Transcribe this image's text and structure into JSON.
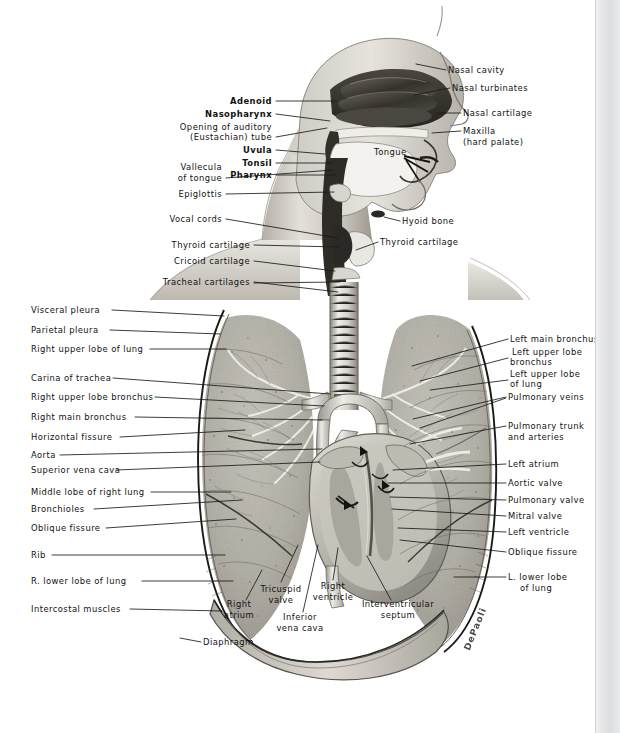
{
  "figure": {
    "signature": "DePaoli"
  },
  "colors": {
    "ink": "#111111",
    "leader": "#1a1a1a",
    "paper": "#ffffff",
    "gutter": "#e4e5e6",
    "lung_tissue": "#b9b6ad",
    "skin_light": "#dcd9d2",
    "skin_mid": "#b8b4ac",
    "cavity_dark": "#3a3733",
    "vessel": "#cfccc4"
  },
  "labels_head_left": [
    {
      "id": "adenoid",
      "text": "Adenoid",
      "bold": true,
      "x": 272,
      "y": 104,
      "align": "right"
    },
    {
      "id": "nasopharynx",
      "text": "Nasopharynx",
      "bold": true,
      "x": 272,
      "y": 117,
      "align": "right"
    },
    {
      "id": "eustachian-1",
      "text": "Opening of auditory",
      "bold": false,
      "x": 272,
      "y": 130,
      "align": "right"
    },
    {
      "id": "eustachian-2",
      "text": "(Eustachian) tube",
      "bold": false,
      "x": 272,
      "y": 140,
      "align": "right"
    },
    {
      "id": "uvula",
      "text": "Uvula",
      "bold": true,
      "x": 272,
      "y": 153,
      "align": "right"
    },
    {
      "id": "tonsil",
      "text": "Tonsil",
      "bold": true,
      "x": 272,
      "y": 166,
      "align": "right"
    },
    {
      "id": "pharynx",
      "text": "Pharynx",
      "bold": true,
      "x": 272,
      "y": 178,
      "align": "right"
    }
  ],
  "labels_neck_left": [
    {
      "id": "vallecula-1",
      "text": "Vallecula",
      "x": 222,
      "y": 170,
      "align": "right"
    },
    {
      "id": "vallecula-2",
      "text": "of tongue",
      "x": 222,
      "y": 181,
      "align": "right"
    },
    {
      "id": "epiglottis",
      "text": "Epiglottis",
      "x": 222,
      "y": 197,
      "align": "right"
    },
    {
      "id": "vocal-cords",
      "text": "Vocal cords",
      "x": 222,
      "y": 222,
      "align": "right"
    },
    {
      "id": "thyroid-cartilage-l",
      "text": "Thyroid cartilage",
      "x": 250,
      "y": 248,
      "align": "right"
    },
    {
      "id": "cricoid-cartilage",
      "text": "Cricoid cartilage",
      "x": 250,
      "y": 264,
      "align": "right"
    },
    {
      "id": "tracheal-cartilages",
      "text": "Tracheal cartilages",
      "x": 250,
      "y": 285,
      "align": "right"
    }
  ],
  "labels_head_right": [
    {
      "id": "nasal-cavity",
      "text": "Nasal cavity",
      "x": 448,
      "y": 73
    },
    {
      "id": "nasal-turbinates",
      "text": "Nasal turbinates",
      "x": 452,
      "y": 91
    },
    {
      "id": "nasal-cartilage",
      "text": "Nasal cartilage",
      "x": 463,
      "y": 116
    },
    {
      "id": "maxilla-1",
      "text": "Maxilla",
      "x": 463,
      "y": 134
    },
    {
      "id": "maxilla-2",
      "text": "(hard palate)",
      "x": 463,
      "y": 145
    },
    {
      "id": "hyoid-bone",
      "text": "Hyoid bone",
      "x": 402,
      "y": 224
    },
    {
      "id": "thyroid-cartilage-r",
      "text": "Thyroid cartilage",
      "x": 380,
      "y": 245
    }
  ],
  "label_tongue": {
    "id": "tongue",
    "text": "Tongue",
    "x": 374,
    "y": 155
  },
  "labels_thorax_left": [
    {
      "id": "visceral-pleura",
      "text": "Visceral pleura",
      "x": 31,
      "y": 313
    },
    {
      "id": "parietal-pleura",
      "text": "Parietal pleura",
      "x": 31,
      "y": 333
    },
    {
      "id": "right-upper-lobe",
      "text": "Right upper lobe of lung",
      "x": 31,
      "y": 352
    },
    {
      "id": "carina-of-trachea",
      "text": "Carina of trachea",
      "x": 31,
      "y": 381
    },
    {
      "id": "right-upper-lobe-bronchus",
      "text": "Right upper lobe bronchus",
      "x": 31,
      "y": 400
    },
    {
      "id": "right-main-bronchus",
      "text": "Right main bronchus",
      "x": 31,
      "y": 420
    },
    {
      "id": "horizontal-fissure",
      "text": "Horizontal fissure",
      "x": 31,
      "y": 440
    },
    {
      "id": "aorta",
      "text": "Aorta",
      "x": 31,
      "y": 458
    },
    {
      "id": "superior-vena-cava",
      "text": "Superior vena cava",
      "x": 31,
      "y": 473
    },
    {
      "id": "middle-lobe-right-lung",
      "text": "Middle lobe of right lung",
      "x": 31,
      "y": 495
    },
    {
      "id": "bronchioles",
      "text": "Bronchioles",
      "x": 31,
      "y": 512
    },
    {
      "id": "oblique-fissure-left",
      "text": "Oblique fissure",
      "x": 31,
      "y": 531
    },
    {
      "id": "rib",
      "text": "Rib",
      "x": 31,
      "y": 558
    },
    {
      "id": "r-lower-lobe-of-lung",
      "text": "R. lower lobe of lung",
      "x": 31,
      "y": 584
    },
    {
      "id": "intercostal-muscles",
      "text": "Intercostal muscles",
      "x": 31,
      "y": 612
    },
    {
      "id": "diaphragm",
      "text": "Diaphragm",
      "x": 203,
      "y": 645
    }
  ],
  "labels_thorax_right": [
    {
      "id": "left-main-bronchus",
      "text": "Left main bronchus",
      "x": 510,
      "y": 342
    },
    {
      "id": "left-upper-lobe-bronchus-1",
      "text": "Left upper lobe",
      "x": 512,
      "y": 355
    },
    {
      "id": "left-upper-lobe-bronchus-2",
      "text": "bronchus",
      "x": 510,
      "y": 365
    },
    {
      "id": "left-upper-lobe-lung-1",
      "text": "Left upper lobe",
      "x": 510,
      "y": 377
    },
    {
      "id": "left-upper-lobe-lung-2",
      "text": "of lung",
      "x": 510,
      "y": 387
    },
    {
      "id": "pulmonary-veins",
      "text": "Pulmonary veins",
      "x": 508,
      "y": 400
    },
    {
      "id": "pulmonary-trunk-1",
      "text": "Pulmonary trunk",
      "x": 508,
      "y": 429
    },
    {
      "id": "pulmonary-trunk-2",
      "text": "and arteries",
      "x": 508,
      "y": 440
    },
    {
      "id": "left-atrium",
      "text": "Left atrium",
      "x": 508,
      "y": 467
    },
    {
      "id": "aortic-valve",
      "text": "Aortic valve",
      "x": 508,
      "y": 486
    },
    {
      "id": "pulmonary-valve",
      "text": "Pulmonary valve",
      "x": 508,
      "y": 503
    },
    {
      "id": "mitral-valve",
      "text": "Mitral valve",
      "x": 508,
      "y": 519
    },
    {
      "id": "left-ventricle",
      "text": "Left ventricle",
      "x": 508,
      "y": 535
    },
    {
      "id": "oblique-fissure-right",
      "text": "Oblique fissure",
      "x": 508,
      "y": 555
    },
    {
      "id": "l-lower-lobe-1",
      "text": "L. lower lobe",
      "x": 508,
      "y": 580
    },
    {
      "id": "l-lower-lobe-2",
      "text": "of lung",
      "x": 520,
      "y": 591
    }
  ],
  "labels_heart_bottom": [
    {
      "id": "right-atrium-1",
      "text": "Right",
      "x": 239,
      "y": 607,
      "align": "center"
    },
    {
      "id": "right-atrium-2",
      "text": "atrium",
      "x": 239,
      "y": 618,
      "align": "center"
    },
    {
      "id": "tricuspid-valve-1",
      "text": "Tricuspid",
      "x": 281,
      "y": 592,
      "align": "center"
    },
    {
      "id": "tricuspid-valve-2",
      "text": "valve",
      "x": 281,
      "y": 603,
      "align": "center"
    },
    {
      "id": "inferior-vena-cava-1",
      "text": "Inferior",
      "x": 300,
      "y": 620,
      "align": "center"
    },
    {
      "id": "inferior-vena-cava-2",
      "text": "vena cava",
      "x": 300,
      "y": 631,
      "align": "center"
    },
    {
      "id": "right-ventricle-1",
      "text": "Right",
      "x": 333,
      "y": 589,
      "align": "center"
    },
    {
      "id": "right-ventricle-2",
      "text": "ventricle",
      "x": 333,
      "y": 600,
      "align": "center"
    },
    {
      "id": "interventricular-1",
      "text": "Interventricular",
      "x": 398,
      "y": 607,
      "align": "center"
    },
    {
      "id": "interventricular-2",
      "text": "septum",
      "x": 398,
      "y": 618,
      "align": "center"
    }
  ],
  "leaders": [
    {
      "id": "ld-adenoid",
      "d": "M276,101 L336,101"
    },
    {
      "id": "ld-nasopharynx",
      "d": "M276,114 L330,121"
    },
    {
      "id": "ld-eustachian",
      "d": "M276,137 L327,128"
    },
    {
      "id": "ld-uvula",
      "d": "M276,150 L325,154"
    },
    {
      "id": "ld-tonsil",
      "d": "M276,163 L332,163"
    },
    {
      "id": "ld-pharynx",
      "d": "M276,175 L336,175"
    },
    {
      "id": "ld-vallecula",
      "d": "M226,178 L333,170"
    },
    {
      "id": "ld-epiglottis",
      "d": "M226,194 L334,192"
    },
    {
      "id": "ld-vocalcords",
      "d": "M226,219 L338,238"
    },
    {
      "id": "ld-thyroid-l",
      "d": "M254,245 L338,247"
    },
    {
      "id": "ld-cricoid",
      "d": "M254,261 L335,271"
    },
    {
      "id": "ld-tracheal-a",
      "d": "M254,282 L338,292"
    },
    {
      "id": "ld-tracheal-b",
      "d": "M254,283 L340,282"
    },
    {
      "id": "ld-nasal-cavity",
      "d": "M446,70 L416,64"
    },
    {
      "id": "ld-nasal-turb",
      "d": "M450,88 L414,95"
    },
    {
      "id": "ld-nasal-cart",
      "d": "M461,113 L437,113"
    },
    {
      "id": "ld-maxilla",
      "d": "M461,131 L432,133"
    },
    {
      "id": "ld-hyoid",
      "d": "M400,221 L384,217"
    },
    {
      "id": "ld-thyroid-r",
      "d": "M378,242 L356,250"
    },
    {
      "id": "ld-visceral",
      "d": "M112,310 L224,316"
    },
    {
      "id": "ld-parietal",
      "d": "M110,330 L220,334"
    },
    {
      "id": "ld-rul",
      "d": "M150,349 L226,349"
    },
    {
      "id": "ld-carina",
      "d": "M113,378 L330,394"
    },
    {
      "id": "ld-rulb",
      "d": "M155,397 L324,406"
    },
    {
      "id": "ld-rmb",
      "d": "M135,417 L322,420"
    },
    {
      "id": "ld-horizontal",
      "d": "M120,437 L245,430"
    },
    {
      "id": "ld-aorta",
      "d": "M60,455 L322,449"
    },
    {
      "id": "ld-svc",
      "d": "M116,470 L320,462"
    },
    {
      "id": "ld-middle-lobe",
      "d": "M151,492 L231,492"
    },
    {
      "id": "ld-bronchioles",
      "d": "M94,509 L242,500"
    },
    {
      "id": "ld-obl-l",
      "d": "M106,528 L236,519"
    },
    {
      "id": "ld-rib",
      "d": "M52,555 L225,555"
    },
    {
      "id": "ld-rlower",
      "d": "M142,581 L233,581"
    },
    {
      "id": "ld-intercostal",
      "d": "M130,609 L222,611"
    },
    {
      "id": "ld-diaphragm",
      "d": "M201,642 L180,638"
    },
    {
      "id": "ld-lmb",
      "d": "M508,339 L412,366"
    },
    {
      "id": "ld-lulb",
      "d": "M508,358 L420,381"
    },
    {
      "id": "ld-lull",
      "d": "M508,380 L430,390"
    },
    {
      "id": "ld-pv",
      "d": "M506,397 L413,419"
    },
    {
      "id": "ld-pv2",
      "d": "M506,398 L420,428"
    },
    {
      "id": "ld-ptrunk",
      "d": "M506,426 L410,444"
    },
    {
      "id": "ld-latrium",
      "d": "M506,464 L393,470"
    },
    {
      "id": "ld-aorticvalve",
      "d": "M506,483 L388,483"
    },
    {
      "id": "ld-pulmvalve",
      "d": "M506,500 L390,497"
    },
    {
      "id": "ld-mitral",
      "d": "M506,516 L392,509"
    },
    {
      "id": "ld-lventricle",
      "d": "M506,532 L398,528"
    },
    {
      "id": "ld-oblr",
      "d": "M506,552 L400,540"
    },
    {
      "id": "ld-llower",
      "d": "M506,577 L454,577"
    },
    {
      "id": "ld-ratrium",
      "d": "M246,600 L262,570"
    },
    {
      "id": "ld-tricuspid",
      "d": "M281,582 L298,545"
    },
    {
      "id": "ld-ivc",
      "d": "M303,612 L318,545"
    },
    {
      "id": "ld-rventricle",
      "d": "M333,580 L338,548"
    },
    {
      "id": "ld-ivseptum",
      "d": "M391,600 L367,556"
    }
  ]
}
